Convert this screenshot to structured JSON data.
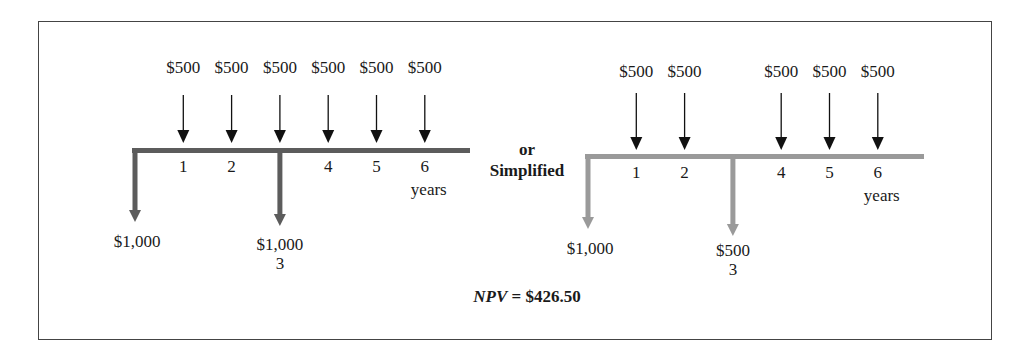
{
  "diagram": {
    "left": {
      "inflow_labels": [
        "$500",
        "$500",
        "$500",
        "$500",
        "$500",
        "$500"
      ],
      "inflow_periods": [
        1,
        2,
        3,
        4,
        5,
        6
      ],
      "period_labels": [
        "1",
        "2",
        "4",
        "5",
        "6"
      ],
      "units_label": "years",
      "outflows": [
        {
          "period": 0,
          "label": "$1,000"
        },
        {
          "period": 3,
          "label": "$1,000",
          "sublabel": "3"
        }
      ],
      "bar_color": "#5c5c5c"
    },
    "connector": {
      "line1": "or",
      "line2": "Simplified"
    },
    "right": {
      "inflow_labels": [
        "$500",
        "$500",
        "$500",
        "$500",
        "$500"
      ],
      "inflow_periods": [
        1,
        2,
        4,
        5,
        6
      ],
      "period_labels": [
        "1",
        "2",
        "4",
        "5",
        "6"
      ],
      "units_label": "years",
      "outflows": [
        {
          "period": 0,
          "label": "$1,000"
        },
        {
          "period": 3,
          "label": "$500",
          "sublabel": "3"
        }
      ],
      "bar_color": "#9a9a9a"
    },
    "result": {
      "npv_label": "NPV",
      "npv_eq": " = $426.50"
    }
  }
}
